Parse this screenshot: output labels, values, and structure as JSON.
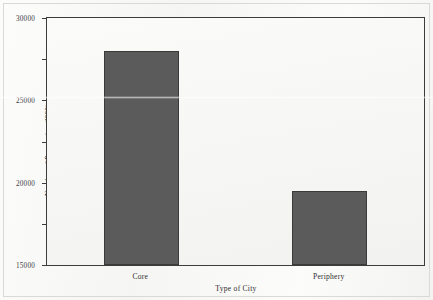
{
  "chart_data": {
    "type": "bar",
    "title": "",
    "categories": [
      "Core",
      "Periphery"
    ],
    "values": [
      26000,
      9000
    ],
    "xlabel": "Type of City",
    "ylabel": "Number of Population ('000)",
    "ylim": [
      0,
      30000
    ],
    "yticks": [
      0,
      5000,
      10000,
      15000,
      20000,
      25000,
      30000
    ],
    "ytick_labels": [
      "0",
      "5000",
      "10000",
      "15000",
      "20000",
      "25000",
      "30000"
    ],
    "grid": false,
    "legend": null,
    "bar_color": "#5b5b5b",
    "frame_color": "#3c3c3c",
    "plot_background": "#f6f6f4"
  }
}
